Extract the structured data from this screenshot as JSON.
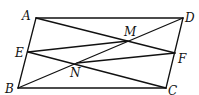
{
  "figure": {
    "type": "geometry-diagram",
    "points": {
      "A": {
        "label": "A",
        "x": 36,
        "y": 18
      },
      "B": {
        "label": "B",
        "x": 18,
        "y": 88
      },
      "C": {
        "label": "C",
        "x": 166,
        "y": 88
      },
      "D": {
        "label": "D",
        "x": 183,
        "y": 18
      },
      "E": {
        "label": "E",
        "x": 28,
        "y": 52
      },
      "F": {
        "label": "F",
        "x": 175,
        "y": 53
      },
      "M": {
        "label": "M",
        "x": 128,
        "y": 41
      },
      "N": {
        "label": "N",
        "x": 77,
        "y": 63
      }
    },
    "segments": [
      [
        "A",
        "D"
      ],
      [
        "D",
        "C"
      ],
      [
        "C",
        "B"
      ],
      [
        "B",
        "A"
      ],
      [
        "A",
        "F"
      ],
      [
        "E",
        "C"
      ],
      [
        "B",
        "D"
      ],
      [
        "E",
        "M"
      ],
      [
        "N",
        "F"
      ]
    ]
  }
}
